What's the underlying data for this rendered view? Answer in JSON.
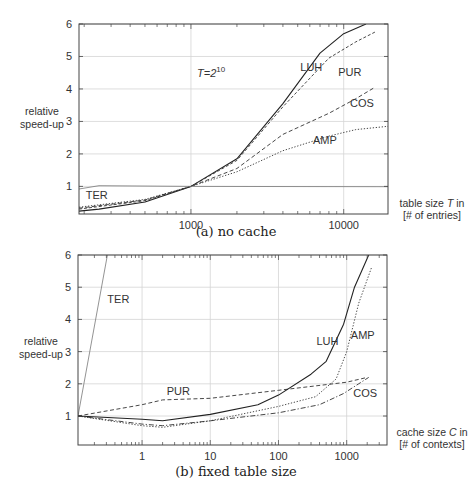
{
  "chart_data": [
    {
      "id": "a",
      "type": "line",
      "caption": "(a) no cache",
      "title": "",
      "annotation": {
        "text_main": "T=2",
        "text_sup": "10",
        "x": 1000,
        "y": 4.9
      },
      "xlabel_line1": "table size T in",
      "xlabel_line2": "[# of entries]",
      "ylabel_line1": "relative",
      "ylabel_line2": "speed-up",
      "xscale": "log",
      "xlim": [
        185,
        19500
      ],
      "ylim": [
        0.15,
        6
      ],
      "xticks": [
        {
          "value": 1000,
          "label": "1000"
        },
        {
          "value": 10000,
          "label": "10000"
        }
      ],
      "yticks": [
        {
          "value": 1,
          "label": "1"
        },
        {
          "value": 2,
          "label": "2"
        },
        {
          "value": 3,
          "label": "3"
        },
        {
          "value": 4,
          "label": "4"
        },
        {
          "value": 5,
          "label": "5"
        },
        {
          "value": 6,
          "label": "6"
        }
      ],
      "grid": true,
      "series": [
        {
          "name": "LUH",
          "style": "solid",
          "label_pos": [
            5200,
            4.55
          ],
          "points": [
            [
              185,
              0.24
            ],
            [
              250,
              0.3
            ],
            [
              500,
              0.52
            ],
            [
              1000,
              1.0
            ],
            [
              2000,
              1.85
            ],
            [
              4000,
              3.55
            ],
            [
              7000,
              5.1
            ],
            [
              10000,
              5.7
            ],
            [
              14000,
              6.0
            ]
          ]
        },
        {
          "name": "PUR",
          "style": "dashed-fine",
          "label_pos": [
            9200,
            4.4
          ],
          "points": [
            [
              185,
              0.3
            ],
            [
              500,
              0.56
            ],
            [
              1000,
              1.0
            ],
            [
              2000,
              1.8
            ],
            [
              4000,
              3.45
            ],
            [
              8000,
              4.95
            ],
            [
              12000,
              5.45
            ],
            [
              16000,
              5.75
            ]
          ]
        },
        {
          "name": "COS",
          "style": "dashed",
          "label_pos": [
            11000,
            3.45
          ],
          "points": [
            [
              185,
              0.33
            ],
            [
              500,
              0.58
            ],
            [
              1000,
              1.0
            ],
            [
              2000,
              1.55
            ],
            [
              4000,
              2.6
            ],
            [
              8000,
              3.25
            ],
            [
              12000,
              3.7
            ],
            [
              16000,
              4.05
            ]
          ]
        },
        {
          "name": "AMP",
          "style": "dotted",
          "label_pos": [
            6300,
            2.3
          ],
          "points": [
            [
              185,
              0.36
            ],
            [
              500,
              0.6
            ],
            [
              1000,
              1.0
            ],
            [
              2000,
              1.45
            ],
            [
              4000,
              2.1
            ],
            [
              8000,
              2.55
            ],
            [
              12000,
              2.75
            ],
            [
              19500,
              2.85
            ]
          ]
        },
        {
          "name": "TER",
          "style": "solid-light",
          "label_pos": [
            205,
            0.62
          ],
          "points": [
            [
              185,
              0.92
            ],
            [
              250,
              1.02
            ],
            [
              1000,
              1.0
            ],
            [
              19500,
              0.99
            ]
          ]
        }
      ]
    },
    {
      "id": "b",
      "type": "line",
      "caption": "(b) fixed table size",
      "title": "",
      "xlabel_line1": "cache size C in",
      "xlabel_line2": "[# of contexts]",
      "ylabel_line1": "relative",
      "ylabel_line2": "speed-up",
      "xscale": "log",
      "xlim": [
        0.115,
        3900
      ],
      "ylim": [
        0.1,
        6
      ],
      "xticks": [
        {
          "value": 1,
          "label": "1"
        },
        {
          "value": 10,
          "label": "10"
        },
        {
          "value": 100,
          "label": "100"
        },
        {
          "value": 1000,
          "label": "1000"
        }
      ],
      "yticks": [
        {
          "value": 1,
          "label": "1"
        },
        {
          "value": 2,
          "label": "2"
        },
        {
          "value": 3,
          "label": "3"
        },
        {
          "value": 4,
          "label": "4"
        },
        {
          "value": 5,
          "label": "5"
        },
        {
          "value": 6,
          "label": "6"
        }
      ],
      "grid": true,
      "series": [
        {
          "name": "TER",
          "style": "solid-light",
          "label_pos": [
            0.31,
            4.5
          ],
          "points": [
            [
              0.115,
              1.0
            ],
            [
              0.31,
              6.0
            ]
          ]
        },
        {
          "name": "PUR",
          "style": "dashed",
          "label_pos": [
            2.3,
            1.65
          ],
          "points": [
            [
              0.115,
              1.0
            ],
            [
              1,
              1.35
            ],
            [
              2,
              1.5
            ],
            [
              10,
              1.55
            ],
            [
              100,
              1.8
            ],
            [
              1000,
              2.05
            ],
            [
              2000,
              2.2
            ]
          ]
        },
        {
          "name": "LUH",
          "style": "solid",
          "label_pos": [
            360,
            3.2
          ],
          "points": [
            [
              0.115,
              1.0
            ],
            [
              1,
              0.9
            ],
            [
              2,
              0.85
            ],
            [
              10,
              1.05
            ],
            [
              50,
              1.35
            ],
            [
              100,
              1.65
            ],
            [
              300,
              2.3
            ],
            [
              500,
              2.7
            ],
            [
              900,
              3.85
            ],
            [
              1300,
              5.0
            ],
            [
              2100,
              6.0
            ]
          ]
        },
        {
          "name": "AMP",
          "style": "dotted",
          "label_pos": [
            1150,
            3.4
          ],
          "points": [
            [
              0.115,
              1.0
            ],
            [
              1,
              0.7
            ],
            [
              2,
              0.65
            ],
            [
              10,
              0.85
            ],
            [
              100,
              1.3
            ],
            [
              350,
              1.6
            ],
            [
              700,
              2.15
            ],
            [
              1000,
              3.0
            ],
            [
              1500,
              4.5
            ],
            [
              2300,
              5.6
            ]
          ]
        },
        {
          "name": "COS",
          "style": "dash-dot",
          "label_pos": [
            1250,
            1.6
          ],
          "points": [
            [
              0.115,
              1.0
            ],
            [
              1,
              0.75
            ],
            [
              2,
              0.7
            ],
            [
              10,
              0.85
            ],
            [
              100,
              1.1
            ],
            [
              400,
              1.35
            ],
            [
              900,
              1.7
            ],
            [
              1500,
              2.0
            ],
            [
              2100,
              2.2
            ]
          ]
        }
      ]
    }
  ]
}
